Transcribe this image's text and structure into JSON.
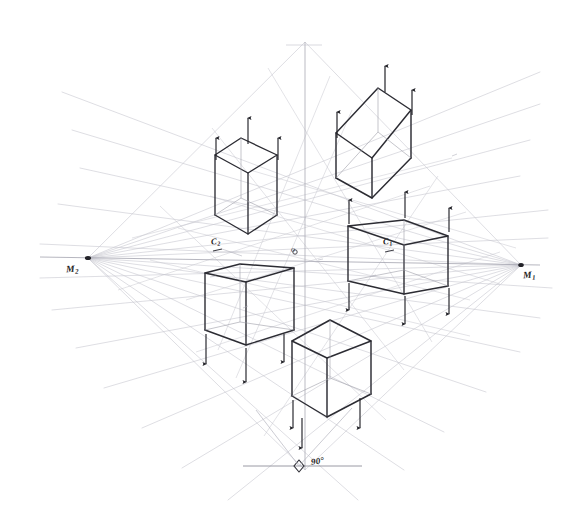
{
  "drawing": {
    "title": "Two-point perspective cube construction",
    "medium": "pencil on white paper",
    "background_color": "#ffffff",
    "ink_color": "#2a2a30",
    "construction_line_color": "#b9b9c2",
    "guide_line_color": "#9a9aa6"
  },
  "labels": {
    "vanishing_point_left": "M",
    "vanishing_point_left_sub": "2",
    "vanishing_point_right": "M",
    "vanishing_point_right_sub": "1",
    "station_point": "o",
    "measure_point_left": "C",
    "measure_point_left_sub": "2",
    "measure_point_right": "C",
    "measure_point_right_sub": "1",
    "angle": "90",
    "angle_unit": "°"
  },
  "points": {
    "vp_left": {
      "x": 88,
      "y": 258
    },
    "vp_right": {
      "x": 521,
      "y": 265
    },
    "center_o": {
      "x": 295,
      "y": 252
    },
    "c_left": {
      "x": 218,
      "y": 243
    },
    "c_right": {
      "x": 389,
      "y": 243
    },
    "angle_marker": {
      "x": 299,
      "y": 466
    }
  },
  "horizon": {
    "y_left": 258,
    "y_right": 265,
    "x_start": 40,
    "x_end": 540
  },
  "vertical_axis": {
    "x": 305,
    "y_top": 42,
    "y_bottom": 470
  },
  "ground_line": {
    "y": 466,
    "x_start": 245,
    "x_end": 355
  },
  "cubes": [
    {
      "id": "cube-upper-left",
      "label": "upper left cube",
      "arrow_direction": "up",
      "arrow_count": 3,
      "above_horizon": true
    },
    {
      "id": "cube-upper-right",
      "label": "upper right cube",
      "arrow_direction": "up",
      "arrow_count": 3,
      "above_horizon": true
    },
    {
      "id": "cube-center-right",
      "label": "center right cube",
      "arrow_direction": "both",
      "arrow_count": 6,
      "above_horizon": false
    },
    {
      "id": "cube-lower-left",
      "label": "lower left cube",
      "arrow_direction": "down",
      "arrow_count": 3,
      "above_horizon": false
    },
    {
      "id": "cube-bottom-center",
      "label": "bottom center cube",
      "arrow_direction": "down",
      "arrow_count": 3,
      "above_horizon": false
    }
  ]
}
